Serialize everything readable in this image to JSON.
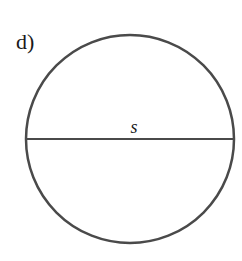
{
  "figure": {
    "part_label": "d)",
    "shape": "circle",
    "segment_label": "s",
    "circle": {
      "cx": 130,
      "cy": 139,
      "r": 104
    },
    "diameter": {
      "x1": 27,
      "y1": 139,
      "x2": 233,
      "y2": 139
    },
    "stroke_color": "#4a4a4a",
    "text_color": "#1a1a1a"
  }
}
